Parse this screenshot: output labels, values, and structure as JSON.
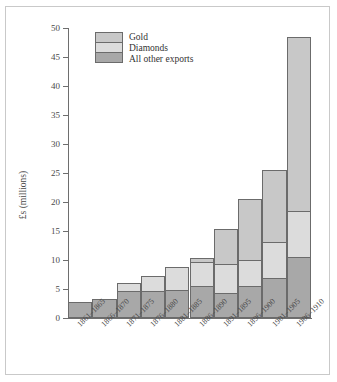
{
  "chart_data": {
    "type": "bar",
    "stacked": true,
    "title": "",
    "xlabel": "",
    "ylabel": "£s (millions)",
    "ylim": [
      0,
      50
    ],
    "ytick_values": [
      0,
      5,
      10,
      15,
      20,
      25,
      30,
      35,
      40,
      45,
      50
    ],
    "ytick_labels": [
      "0",
      "5",
      "10",
      "15",
      "20",
      "25",
      "30",
      "35",
      "40",
      "45",
      "50"
    ],
    "grid": false,
    "legend_position": "top-left",
    "categories": [
      "1861–1865",
      "1866–1870",
      "1871–1875",
      "1876–1880",
      "1881–1885",
      "1886–1890",
      "1891–1895",
      "1896–1900",
      "1901–1905",
      "1906–1910"
    ],
    "series": [
      {
        "name": "All other exports",
        "color": "#a8a8a8",
        "values": [
          2.6,
          3.1,
          4.4,
          4.4,
          4.7,
          5.3,
          4.1,
          5.3,
          6.7,
          10.4
        ]
      },
      {
        "name": "Diamonds",
        "color": "#dcdcdc",
        "values": [
          0.0,
          0.0,
          1.5,
          2.6,
          4.0,
          4.2,
          5.0,
          4.5,
          6.3,
          7.9
        ]
      },
      {
        "name": "Gold",
        "color": "#c8c8c8",
        "values": [
          0.0,
          0.0,
          0.0,
          0.0,
          0.0,
          0.7,
          6.0,
          10.5,
          12.4,
          30.0
        ]
      }
    ],
    "totals": [
      2.6,
      3.1,
      5.9,
      7.0,
      8.7,
      10.2,
      15.1,
      20.3,
      25.4,
      48.3
    ]
  },
  "legend": {
    "items": [
      {
        "label": "Gold",
        "key": "gold"
      },
      {
        "label": "Diamonds",
        "key": "diamonds"
      },
      {
        "label": "All other exports",
        "key": "other"
      }
    ]
  },
  "colors": {
    "gold": "#c8c8c8",
    "diamonds": "#dcdcdc",
    "other": "#a8a8a8",
    "outline": "#6b6b6b",
    "axis": "#6e6e6e",
    "frame": "#c9c9c9",
    "text": "#4a4a4a"
  }
}
